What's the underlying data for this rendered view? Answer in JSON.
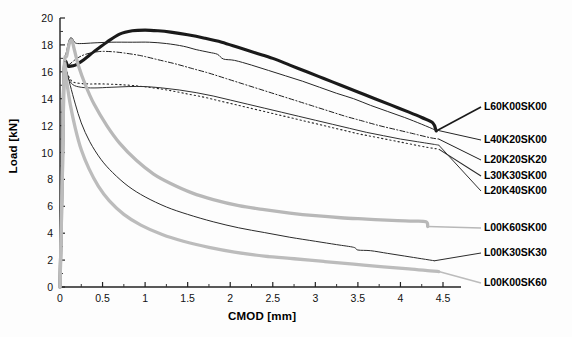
{
  "chart_data": {
    "type": "line",
    "title": "",
    "xlabel": "CMOD [mm]",
    "ylabel": "Load [kN]",
    "xlim": [
      0,
      4.5
    ],
    "ylim": [
      0,
      20
    ],
    "xticks": [
      "0",
      "0.5",
      "1",
      "1.5",
      "2",
      "2.5",
      "3",
      "3.5",
      "4",
      "4.5"
    ],
    "yticks": [
      "0",
      "2",
      "4",
      "6",
      "8",
      "10",
      "12",
      "14",
      "16",
      "18",
      "20"
    ],
    "xtick_values": [
      0,
      0.5,
      1,
      1.5,
      2,
      2.5,
      3,
      3.5,
      4,
      4.5
    ],
    "ytick_values": [
      0,
      2,
      4,
      6,
      8,
      10,
      12,
      14,
      16,
      18,
      20
    ],
    "grid": false,
    "legend_position": "right-inline-labels",
    "series": [
      {
        "name": "L60K00SK00",
        "style": "solid",
        "color": "#1a1a1a",
        "width": 3.1,
        "label_x": 484,
        "label_y": 107,
        "points": [
          [
            0,
            0
          ],
          [
            0.03,
            10.0
          ],
          [
            0.05,
            16.3
          ],
          [
            0.1,
            16.4
          ],
          [
            0.18,
            16.5
          ],
          [
            0.28,
            16.9
          ],
          [
            0.4,
            17.5
          ],
          [
            0.55,
            18.2
          ],
          [
            0.7,
            18.8
          ],
          [
            0.85,
            19.05
          ],
          [
            1.0,
            19.1
          ],
          [
            1.15,
            19.05
          ],
          [
            1.3,
            18.95
          ],
          [
            1.5,
            18.75
          ],
          [
            1.7,
            18.5
          ],
          [
            1.9,
            18.2
          ],
          [
            2.1,
            17.8
          ],
          [
            2.3,
            17.4
          ],
          [
            2.5,
            17.0
          ],
          [
            2.7,
            16.5
          ],
          [
            2.9,
            16.0
          ],
          [
            3.1,
            15.5
          ],
          [
            3.3,
            15.0
          ],
          [
            3.5,
            14.5
          ],
          [
            3.7,
            14.0
          ],
          [
            3.9,
            13.5
          ],
          [
            4.1,
            13.0
          ],
          [
            4.25,
            12.6
          ],
          [
            4.38,
            12.2
          ],
          [
            4.42,
            11.6
          ]
        ]
      },
      {
        "name": "L40K20SK00",
        "style": "solid",
        "color": "#262626",
        "width": 1.0,
        "label_x": 484,
        "label_y": 140,
        "points": [
          [
            0,
            0
          ],
          [
            0.03,
            10.5
          ],
          [
            0.05,
            16.3
          ],
          [
            0.08,
            17.6
          ],
          [
            0.11,
            18.4
          ],
          [
            0.14,
            18.5
          ],
          [
            0.18,
            18.15
          ],
          [
            0.25,
            18.1
          ],
          [
            0.4,
            18.15
          ],
          [
            0.6,
            18.2
          ],
          [
            0.85,
            18.2
          ],
          [
            1.05,
            18.2
          ],
          [
            1.25,
            18.1
          ],
          [
            1.45,
            17.9
          ],
          [
            1.6,
            17.65
          ],
          [
            1.75,
            17.45
          ],
          [
            1.85,
            17.3
          ],
          [
            1.92,
            16.95
          ],
          [
            2.05,
            16.85
          ],
          [
            2.25,
            16.5
          ],
          [
            2.45,
            16.1
          ],
          [
            2.65,
            15.7
          ],
          [
            2.85,
            15.3
          ],
          [
            3.05,
            14.85
          ],
          [
            3.25,
            14.4
          ],
          [
            3.45,
            14.0
          ],
          [
            3.65,
            13.5
          ],
          [
            3.85,
            13.05
          ],
          [
            4.05,
            12.6
          ],
          [
            4.25,
            12.1
          ],
          [
            4.4,
            11.7
          ]
        ]
      },
      {
        "name": "L20K20SK20",
        "style": "dashdot",
        "color": "#1f1f1f",
        "width": 1.0,
        "label_x": 484,
        "label_y": 160,
        "points": [
          [
            0,
            0
          ],
          [
            0.03,
            10.2
          ],
          [
            0.05,
            16.3
          ],
          [
            0.1,
            16.5
          ],
          [
            0.2,
            17.0
          ],
          [
            0.3,
            17.3
          ],
          [
            0.45,
            17.5
          ],
          [
            0.6,
            17.5
          ],
          [
            0.75,
            17.4
          ],
          [
            0.95,
            17.2
          ],
          [
            1.15,
            16.9
          ],
          [
            1.35,
            16.6
          ],
          [
            1.55,
            16.25
          ],
          [
            1.75,
            15.9
          ],
          [
            1.95,
            15.5
          ],
          [
            2.15,
            15.1
          ],
          [
            2.35,
            14.7
          ],
          [
            2.55,
            14.3
          ],
          [
            2.75,
            13.9
          ],
          [
            2.95,
            13.5
          ],
          [
            3.15,
            13.1
          ],
          [
            3.35,
            12.7
          ],
          [
            3.55,
            12.35
          ],
          [
            3.75,
            12.0
          ],
          [
            3.95,
            11.7
          ],
          [
            4.15,
            11.4
          ],
          [
            4.35,
            11.1
          ],
          [
            4.45,
            11.0
          ]
        ]
      },
      {
        "name": "L30K30SK00",
        "style": "dotted",
        "color": "#2a2a2a",
        "width": 1.1,
        "label_x": 484,
        "label_y": 176,
        "points": [
          [
            0,
            0
          ],
          [
            0.03,
            9.8
          ],
          [
            0.05,
            16.3
          ],
          [
            0.09,
            15.8
          ],
          [
            0.14,
            15.3
          ],
          [
            0.22,
            15.15
          ],
          [
            0.35,
            15.1
          ],
          [
            0.5,
            15.1
          ],
          [
            0.7,
            15.05
          ],
          [
            0.9,
            14.95
          ],
          [
            1.1,
            14.8
          ],
          [
            1.3,
            14.6
          ],
          [
            1.5,
            14.35
          ],
          [
            1.7,
            14.1
          ],
          [
            1.9,
            13.8
          ],
          [
            2.1,
            13.5
          ],
          [
            2.3,
            13.2
          ],
          [
            2.5,
            12.9
          ],
          [
            2.7,
            12.6
          ],
          [
            2.9,
            12.3
          ],
          [
            3.1,
            12.0
          ],
          [
            3.3,
            11.7
          ],
          [
            3.5,
            11.4
          ],
          [
            3.7,
            11.15
          ],
          [
            3.9,
            10.9
          ],
          [
            4.1,
            10.65
          ],
          [
            4.3,
            10.4
          ],
          [
            4.45,
            10.25
          ]
        ]
      },
      {
        "name": "L20K40SK00",
        "style": "solid",
        "color": "#303030",
        "width": 1.0,
        "label_x": 484,
        "label_y": 191,
        "points": [
          [
            0,
            0
          ],
          [
            0.03,
            9.6
          ],
          [
            0.05,
            16.3
          ],
          [
            0.09,
            15.6
          ],
          [
            0.15,
            15.05
          ],
          [
            0.25,
            14.85
          ],
          [
            0.4,
            14.8
          ],
          [
            0.6,
            14.85
          ],
          [
            0.8,
            14.9
          ],
          [
            1.0,
            14.9
          ],
          [
            1.2,
            14.8
          ],
          [
            1.4,
            14.65
          ],
          [
            1.6,
            14.45
          ],
          [
            1.8,
            14.2
          ],
          [
            2.0,
            13.9
          ],
          [
            2.2,
            13.6
          ],
          [
            2.4,
            13.3
          ],
          [
            2.6,
            13.0
          ],
          [
            2.8,
            12.7
          ],
          [
            3.0,
            12.4
          ],
          [
            3.2,
            12.1
          ],
          [
            3.4,
            11.8
          ],
          [
            3.6,
            11.5
          ],
          [
            3.8,
            11.25
          ],
          [
            4.0,
            11.0
          ],
          [
            4.2,
            10.8
          ],
          [
            4.4,
            10.6
          ],
          [
            4.45,
            10.55
          ]
        ]
      },
      {
        "name": "L00K60SK00",
        "style": "solid",
        "color": "#b8b8b8",
        "width": 3.3,
        "label_x": 484,
        "label_y": 228,
        "points": [
          [
            0,
            0
          ],
          [
            0.03,
            9.0
          ],
          [
            0.05,
            16.3
          ],
          [
            0.08,
            17.2
          ],
          [
            0.11,
            18.1
          ],
          [
            0.14,
            18.3
          ],
          [
            0.17,
            17.6
          ],
          [
            0.22,
            16.4
          ],
          [
            0.3,
            15.0
          ],
          [
            0.4,
            13.6
          ],
          [
            0.55,
            12.0
          ],
          [
            0.7,
            10.7
          ],
          [
            0.9,
            9.4
          ],
          [
            1.1,
            8.4
          ],
          [
            1.3,
            7.7
          ],
          [
            1.55,
            7.0
          ],
          [
            1.8,
            6.5
          ],
          [
            2.1,
            6.05
          ],
          [
            2.4,
            5.75
          ],
          [
            2.7,
            5.5
          ],
          [
            3.0,
            5.3
          ],
          [
            3.3,
            5.15
          ],
          [
            3.6,
            5.05
          ],
          [
            3.9,
            4.95
          ],
          [
            4.15,
            4.9
          ],
          [
            4.3,
            4.85
          ],
          [
            4.32,
            4.5
          ]
        ]
      },
      {
        "name": "L00K30SK30",
        "style": "solid",
        "color": "#2b2b2b",
        "width": 1.0,
        "label_x": 484,
        "label_y": 253,
        "points": [
          [
            0,
            0
          ],
          [
            0.03,
            9.5
          ],
          [
            0.05,
            16.3
          ],
          [
            0.08,
            16.0
          ],
          [
            0.12,
            15.0
          ],
          [
            0.18,
            13.6
          ],
          [
            0.25,
            12.2
          ],
          [
            0.35,
            10.8
          ],
          [
            0.48,
            9.5
          ],
          [
            0.62,
            8.5
          ],
          [
            0.8,
            7.5
          ],
          [
            1.0,
            6.7
          ],
          [
            1.25,
            5.95
          ],
          [
            1.5,
            5.4
          ],
          [
            1.8,
            4.85
          ],
          [
            2.1,
            4.4
          ],
          [
            2.4,
            4.05
          ],
          [
            2.7,
            3.7
          ],
          [
            3.0,
            3.4
          ],
          [
            3.25,
            3.15
          ],
          [
            3.45,
            2.95
          ],
          [
            3.5,
            2.75
          ],
          [
            3.65,
            2.7
          ],
          [
            3.85,
            2.5
          ],
          [
            4.05,
            2.3
          ],
          [
            4.25,
            2.1
          ],
          [
            4.4,
            1.95
          ]
        ]
      },
      {
        "name": "L00K00SK60",
        "style": "solid",
        "color": "#bcbcbc",
        "width": 3.3,
        "label_x": 484,
        "label_y": 283,
        "points": [
          [
            0,
            0
          ],
          [
            0.03,
            9.2
          ],
          [
            0.05,
            16.3
          ],
          [
            0.08,
            15.2
          ],
          [
            0.12,
            13.6
          ],
          [
            0.18,
            11.8
          ],
          [
            0.25,
            10.2
          ],
          [
            0.34,
            8.8
          ],
          [
            0.45,
            7.5
          ],
          [
            0.58,
            6.4
          ],
          [
            0.75,
            5.4
          ],
          [
            0.95,
            4.6
          ],
          [
            1.2,
            3.9
          ],
          [
            1.45,
            3.4
          ],
          [
            1.75,
            2.95
          ],
          [
            2.05,
            2.6
          ],
          [
            2.4,
            2.3
          ],
          [
            2.75,
            2.1
          ],
          [
            3.1,
            1.9
          ],
          [
            3.45,
            1.7
          ],
          [
            3.8,
            1.5
          ],
          [
            4.1,
            1.35
          ],
          [
            4.35,
            1.2
          ],
          [
            4.45,
            1.15
          ]
        ]
      }
    ]
  },
  "axes": {
    "x_label": "CMOD [mm]",
    "y_label": "Load [kN]"
  }
}
